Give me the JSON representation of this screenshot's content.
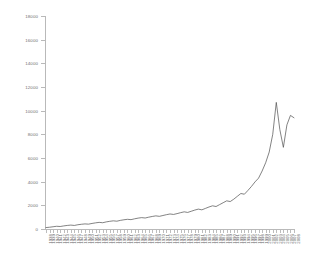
{
  "chart_data": {
    "type": "line",
    "title": "",
    "subtitle": "",
    "xlabel": "",
    "ylabel": "",
    "grid": false,
    "legend": "none",
    "line_color": "#4d4d4d",
    "axis_color": "#b9b9b9",
    "tick_label_color": "#6e6e6e",
    "background": "#ffffff",
    "ylim": [
      0,
      18000
    ],
    "yticks": [
      0,
      2000,
      4000,
      6000,
      8000,
      10000,
      12000,
      14000,
      16000,
      18000
    ],
    "ytick_labels": [
      "0",
      "2000",
      "4000",
      "6000",
      "8000",
      "10000",
      "12000",
      "14000",
      "16000",
      "18000"
    ],
    "xlim": [
      1938,
      2008
    ],
    "x": [
      1938,
      1939,
      1940,
      1941,
      1942,
      1943,
      1944,
      1945,
      1946,
      1947,
      1948,
      1949,
      1950,
      1951,
      1952,
      1953,
      1954,
      1955,
      1956,
      1957,
      1958,
      1959,
      1960,
      1961,
      1962,
      1963,
      1964,
      1965,
      1966,
      1967,
      1968,
      1969,
      1970,
      1971,
      1972,
      1973,
      1974,
      1975,
      1976,
      1977,
      1978,
      1979,
      1980,
      1981,
      1982,
      1983,
      1984,
      1985,
      1986,
      1987,
      1988,
      1989,
      1990,
      1991,
      1992,
      1993,
      1994,
      1995,
      1996,
      1997,
      1998,
      1999,
      2000,
      2001,
      2002,
      2003,
      2004,
      2005,
      2006,
      2007,
      2008
    ],
    "xtick_labels": [
      "1938",
      "1939",
      "1940",
      "1941",
      "1942",
      "1943",
      "1944",
      "1945",
      "1946",
      "1947",
      "1948",
      "1949",
      "1950",
      "1951",
      "1952",
      "1953",
      "1954",
      "1955",
      "1956",
      "1957",
      "1958",
      "1959",
      "1960",
      "1961",
      "1962",
      "1963",
      "1964",
      "1965",
      "1966",
      "1967",
      "1968",
      "1969",
      "1970",
      "1971",
      "1972",
      "1973",
      "1974",
      "1975",
      "1976",
      "1977",
      "1978",
      "1979",
      "1980",
      "1981",
      "1982",
      "1983",
      "1984",
      "1985",
      "1986",
      "1987",
      "1988",
      "1989",
      "1990",
      "1991",
      "1992",
      "1993",
      "1994",
      "1995",
      "1996",
      "1997",
      "1998",
      "1999",
      "2000",
      "2001",
      "2002",
      "2003",
      "2004",
      "2005",
      "2006",
      "2007",
      "2008"
    ],
    "categories": [
      "1938",
      "1939",
      "1940",
      "1941",
      "1942",
      "1943",
      "1944",
      "1945",
      "1946",
      "1947",
      "1948",
      "1949",
      "1950",
      "1951",
      "1952",
      "1953",
      "1954",
      "1955",
      "1956",
      "1957",
      "1958",
      "1959",
      "1960",
      "1961",
      "1962",
      "1963",
      "1964",
      "1965",
      "1966",
      "1967",
      "1968",
      "1969",
      "1970",
      "1971",
      "1972",
      "1973",
      "1974",
      "1975",
      "1976",
      "1977",
      "1978",
      "1979",
      "1980",
      "1981",
      "1982",
      "1983",
      "1984",
      "1985",
      "1986",
      "1987",
      "1988",
      "1989",
      "1990",
      "1991",
      "1992",
      "1993",
      "1994",
      "1995",
      "1996",
      "1997",
      "1998",
      "1999",
      "2000",
      "2001",
      "2002",
      "2003",
      "2004",
      "2005",
      "2006",
      "2007",
      "2008"
    ],
    "values": [
      120,
      150,
      190,
      230,
      210,
      260,
      300,
      330,
      300,
      360,
      400,
      430,
      410,
      470,
      520,
      560,
      530,
      600,
      650,
      690,
      660,
      730,
      780,
      820,
      790,
      860,
      920,
      960,
      930,
      1000,
      1060,
      1110,
      1070,
      1140,
      1210,
      1270,
      1230,
      1300,
      1380,
      1450,
      1400,
      1500,
      1600,
      1680,
      1620,
      1740,
      1860,
      1960,
      1900,
      2060,
      2220,
      2380,
      2320,
      2520,
      2760,
      3000,
      2940,
      3260,
      3600,
      3980,
      4300,
      4900,
      5600,
      6500,
      8000,
      10700,
      8400,
      6900,
      8800,
      9600,
      9400
    ],
    "series": [
      {
        "name": "value",
        "values": [
          120,
          150,
          190,
          230,
          210,
          260,
          300,
          330,
          300,
          360,
          400,
          430,
          410,
          470,
          520,
          560,
          530,
          600,
          650,
          690,
          660,
          730,
          780,
          820,
          790,
          860,
          920,
          960,
          930,
          1000,
          1060,
          1110,
          1070,
          1140,
          1210,
          1270,
          1230,
          1300,
          1380,
          1450,
          1400,
          1500,
          1600,
          1680,
          1620,
          1740,
          1860,
          1960,
          1900,
          2060,
          2220,
          2380,
          2320,
          2520,
          2760,
          3000,
          2940,
          3260,
          3600,
          3980,
          4300,
          4900,
          5600,
          6500,
          8000,
          10700,
          8400,
          6900,
          8800,
          9600,
          9400
        ]
      }
    ]
  }
}
